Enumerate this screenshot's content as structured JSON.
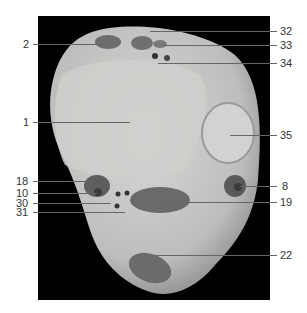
{
  "figure": {
    "labels_left": [
      {
        "id": "2",
        "text": "2"
      },
      {
        "id": "1",
        "text": "1"
      },
      {
        "id": "18",
        "text": "18"
      },
      {
        "id": "10",
        "text": "10"
      },
      {
        "id": "30",
        "text": "30"
      },
      {
        "id": "31",
        "text": "31"
      }
    ],
    "labels_right": [
      {
        "id": "32",
        "text": "32"
      },
      {
        "id": "33",
        "text": "33"
      },
      {
        "id": "34",
        "text": "34"
      },
      {
        "id": "35",
        "text": "35"
      },
      {
        "id": "8",
        "text": "8"
      },
      {
        "id": "19",
        "text": "19"
      },
      {
        "id": "22",
        "text": "22"
      }
    ],
    "colors": {
      "background": "#000000",
      "tissue": "#c8c8c8",
      "muscle": "#6e6e6e"
    }
  }
}
